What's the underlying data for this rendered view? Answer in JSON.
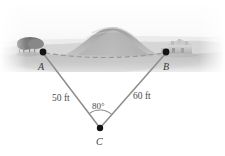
{
  "figure": {
    "name": "triangle-surveying-diagram",
    "background_description": "grayscale photograph of a large hill with a tree at left and a building at right",
    "colors": {
      "line": "#8c8c8c",
      "dot": "#1a1a1a",
      "dashed_line": "#9a9a9a",
      "text": "#3f3f3f",
      "sky": "#fdfdfd",
      "hill_dark": "#9a9a9a",
      "hill_light": "#c6c6c6",
      "ground": "#d2d2d2"
    }
  },
  "vertices": [
    {
      "id": "A",
      "label": "A",
      "x": 43,
      "y": 52,
      "label_x": 38,
      "label_y": 62
    },
    {
      "id": "B",
      "label": "B",
      "x": 166,
      "y": 52,
      "label_x": 163,
      "label_y": 62
    },
    {
      "id": "C",
      "label": "C",
      "x": 100,
      "y": 128,
      "label_x": 96,
      "label_y": 137
    }
  ],
  "measurements": {
    "side_ac": {
      "value": "50 ft",
      "x": 52,
      "y": 94
    },
    "side_bc": {
      "value": "60 ft",
      "x": 133,
      "y": 92
    },
    "angle_c": {
      "value": "80°",
      "x": 92,
      "y": 102
    }
  },
  "segments": [
    {
      "name": "segment-a-to-c",
      "from": "A",
      "to": "C",
      "style": "solid"
    },
    {
      "name": "segment-b-to-c",
      "from": "B",
      "to": "C",
      "style": "solid"
    },
    {
      "name": "segment-a-to-b",
      "from": "A",
      "to": "B",
      "style": "dashed"
    }
  ],
  "arc": {
    "name": "angle-arc-at-c",
    "center": "C",
    "radius": 18
  }
}
